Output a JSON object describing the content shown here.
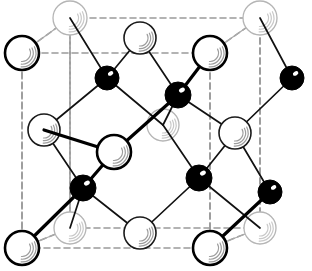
{
  "figure": {
    "width": 312,
    "height": 271,
    "background_color": "#ffffff"
  },
  "legend": {
    "open_circle_meaning": "large open sphere atom (anion / larger species)",
    "filled_circle_meaning": "small filled black sphere atom (cation / smaller species)"
  },
  "styles": {
    "cell_edge_color": "#9a9a9a",
    "cell_edge_dash": "6,4",
    "cell_edge_width": 1.6,
    "bond_front_color": "#000000",
    "bond_front_width": 3.2,
    "bond_mid_color": "#111111",
    "bond_mid_width": 1.7,
    "bond_back_color": "#aaaaaa",
    "bond_back_width": 1.2,
    "sphere_open_fill": "#ffffff",
    "sphere_open_stroke_front": "#000000",
    "sphere_open_stroke_front_width": 2.6,
    "sphere_open_stroke_mid": "#1a1a1a",
    "sphere_open_stroke_mid_width": 1.6,
    "sphere_open_stroke_back": "#b5b5b5",
    "sphere_open_stroke_back_width": 1.3,
    "sphere_filled_fill": "#000000",
    "sphere_filled_stroke": "#000000",
    "highlight_color": "#9d9d9d"
  },
  "cell": {
    "name": "unit-cell-box",
    "front_face": [
      {
        "x": 22,
        "y": 53
      },
      {
        "x": 210,
        "y": 53
      },
      {
        "x": 210,
        "y": 248
      },
      {
        "x": 22,
        "y": 248
      }
    ],
    "back_face": [
      {
        "x": 70,
        "y": 18
      },
      {
        "x": 260,
        "y": 18
      },
      {
        "x": 260,
        "y": 228
      },
      {
        "x": 70,
        "y": 228
      }
    ],
    "connectors": [
      [
        {
          "x": 22,
          "y": 53
        },
        {
          "x": 70,
          "y": 18
        }
      ],
      [
        {
          "x": 210,
          "y": 53
        },
        {
          "x": 260,
          "y": 18
        }
      ],
      [
        {
          "x": 210,
          "y": 248
        },
        {
          "x": 260,
          "y": 228
        }
      ],
      [
        {
          "x": 22,
          "y": 248
        },
        {
          "x": 70,
          "y": 228
        }
      ]
    ],
    "mid_verticals": [
      [
        {
          "x": 70,
          "y": 18
        },
        {
          "x": 70,
          "y": 228
        }
      ],
      [
        {
          "x": 210,
          "y": 53
        },
        {
          "x": 210,
          "y": 248
        }
      ],
      [
        {
          "x": 260,
          "y": 18
        },
        {
          "x": 260,
          "y": 228
        }
      ],
      [
        {
          "x": 22,
          "y": 53
        },
        {
          "x": 22,
          "y": 248
        }
      ]
    ]
  },
  "atoms": {
    "open": [
      {
        "id": "O-back-TL",
        "x": 70,
        "y": 18,
        "r": 17,
        "depth": "back"
      },
      {
        "id": "O-back-TR",
        "x": 260,
        "y": 18,
        "r": 17,
        "depth": "back"
      },
      {
        "id": "O-front-TL",
        "x": 22,
        "y": 53,
        "r": 17,
        "depth": "front"
      },
      {
        "id": "O-top-mid",
        "x": 140,
        "y": 38,
        "r": 16,
        "depth": "mid"
      },
      {
        "id": "O-top-right",
        "x": 210,
        "y": 53,
        "r": 17,
        "depth": "front"
      },
      {
        "id": "O-mid-left",
        "x": 44,
        "y": 130,
        "r": 16,
        "depth": "mid"
      },
      {
        "id": "O-center-back",
        "x": 163,
        "y": 125,
        "r": 16,
        "depth": "back"
      },
      {
        "id": "O-center-front",
        "x": 114,
        "y": 152,
        "r": 17,
        "depth": "front"
      },
      {
        "id": "O-mid-right",
        "x": 235,
        "y": 133,
        "r": 16,
        "depth": "mid"
      },
      {
        "id": "O-low-back-L",
        "x": 70,
        "y": 228,
        "r": 16,
        "depth": "back"
      },
      {
        "id": "O-low-mid",
        "x": 140,
        "y": 233,
        "r": 16,
        "depth": "mid"
      },
      {
        "id": "O-low-back-R",
        "x": 260,
        "y": 228,
        "r": 16,
        "depth": "back"
      },
      {
        "id": "O-bot-left",
        "x": 22,
        "y": 248,
        "r": 17,
        "depth": "front"
      },
      {
        "id": "O-bot-right",
        "x": 210,
        "y": 248,
        "r": 17,
        "depth": "front"
      }
    ],
    "filled": [
      {
        "id": "B-upper-left",
        "x": 107,
        "y": 78,
        "r": 12
      },
      {
        "id": "B-upper-mid",
        "x": 178,
        "y": 95,
        "r": 13
      },
      {
        "id": "B-upper-right",
        "x": 292,
        "y": 78,
        "r": 12
      },
      {
        "id": "B-lower-left",
        "x": 83,
        "y": 188,
        "r": 13
      },
      {
        "id": "B-lower-mid",
        "x": 199,
        "y": 178,
        "r": 13
      },
      {
        "id": "B-lower-right",
        "x": 270,
        "y": 192,
        "r": 12
      }
    ]
  },
  "bonds": {
    "back": [
      [
        "O-back-TL",
        "O-front-TL"
      ],
      [
        "O-back-TR",
        "O-top-right"
      ],
      [
        "O-low-back-L",
        "O-bot-left"
      ],
      [
        "O-low-back-R",
        "O-bot-right"
      ]
    ],
    "mid": [
      [
        "O-back-TL",
        "B-upper-left"
      ],
      [
        "O-top-mid",
        "B-upper-left"
      ],
      [
        "O-top-mid",
        "B-upper-mid"
      ],
      [
        "O-back-TR",
        "B-upper-right"
      ],
      [
        "B-upper-right",
        "O-mid-right"
      ],
      [
        "B-upper-left",
        "O-mid-left"
      ],
      [
        "B-upper-left",
        "O-center-back"
      ],
      [
        "B-upper-mid",
        "O-center-back"
      ],
      [
        "O-center-back",
        "B-lower-mid"
      ],
      [
        "O-mid-left",
        "B-lower-left"
      ],
      [
        "O-mid-right",
        "B-lower-mid"
      ],
      [
        "O-mid-right",
        "B-lower-right"
      ],
      [
        "B-lower-left",
        "O-low-mid"
      ],
      [
        "B-lower-mid",
        "O-low-mid"
      ],
      [
        "B-lower-mid",
        "O-low-back-R"
      ],
      [
        "B-lower-left",
        "O-low-back-L"
      ],
      [
        "B-upper-mid",
        "O-mid-right"
      ]
    ],
    "front": [
      [
        "O-top-right",
        "B-upper-mid"
      ],
      [
        "B-upper-mid",
        "O-center-front"
      ],
      [
        "O-center-front",
        "B-lower-left"
      ],
      [
        "B-lower-left",
        "O-bot-left"
      ],
      [
        "B-lower-right",
        "O-bot-right"
      ],
      [
        "O-center-front",
        "O-mid-left"
      ]
    ]
  }
}
